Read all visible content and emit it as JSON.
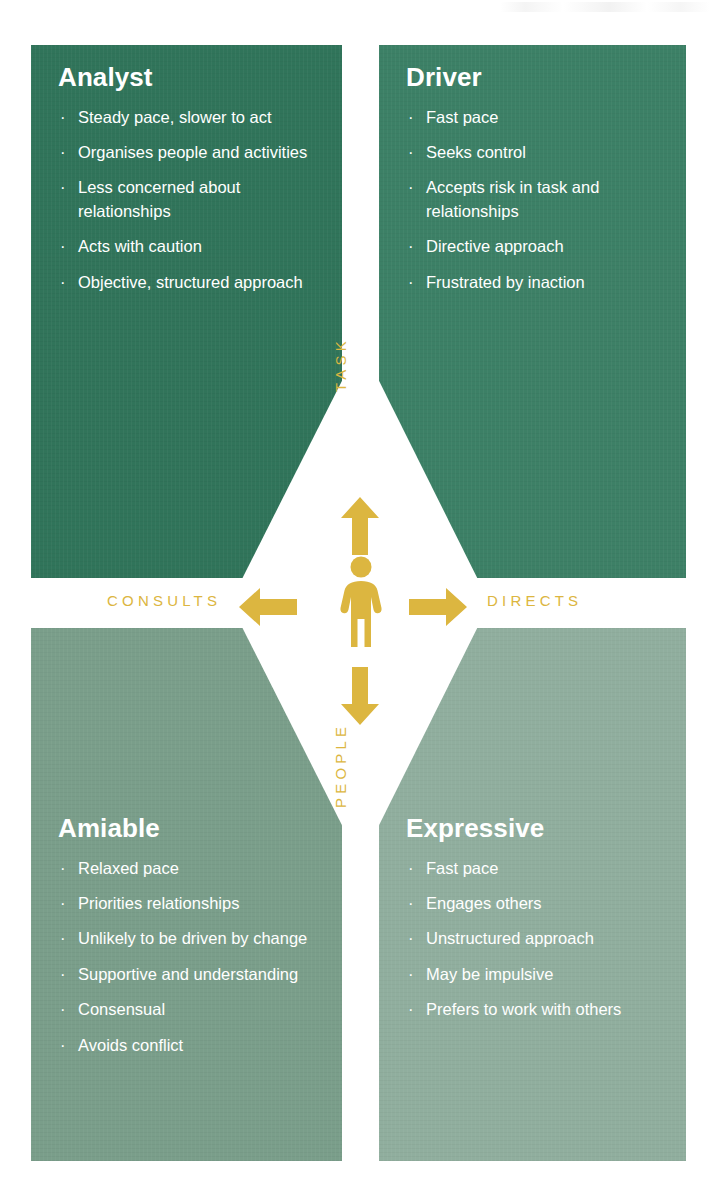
{
  "diagram": {
    "colors": {
      "analyst_bg": "#31745a",
      "driver_bg": "#3d8066",
      "amiable_bg": "#7a9e8a",
      "expressive_bg": "#90ae9e",
      "accent_gold": "#dcb640",
      "text_on_panel": "#ffffff",
      "page_bg": "#ffffff"
    },
    "bullet_glyph": "·",
    "axes": {
      "vertical_top": "TASK",
      "vertical_bottom": "PEOPLE",
      "horizontal_left": "CONSULTS",
      "horizontal_right": "DIRECTS"
    },
    "center_icon": "person-icon",
    "arrows": [
      {
        "name": "arrow-up-icon",
        "direction": "up",
        "points_to": "TASK"
      },
      {
        "name": "arrow-down-icon",
        "direction": "down",
        "points_to": "PEOPLE"
      },
      {
        "name": "arrow-left-icon",
        "direction": "left",
        "points_to": "CONSULTS"
      },
      {
        "name": "arrow-right-icon",
        "direction": "right",
        "points_to": "DIRECTS"
      }
    ],
    "quadrants": [
      {
        "key": "analyst",
        "position": "top-left",
        "title": "Analyst",
        "traits": [
          "Steady pace, slower to act",
          "Organises people and activities",
          "Less concerned about relationships",
          "Acts with caution",
          "Objective, structured approach"
        ]
      },
      {
        "key": "driver",
        "position": "top-right",
        "title": "Driver",
        "traits": [
          "Fast pace",
          "Seeks control",
          "Accepts risk in task and relationships",
          "Directive approach",
          "Frustrated by inaction"
        ]
      },
      {
        "key": "amiable",
        "position": "bottom-left",
        "title": "Amiable",
        "traits": [
          "Relaxed pace",
          "Priorities relationships",
          "Unlikely to be driven by change",
          "Supportive and understanding",
          "Consensual",
          "Avoids conflict"
        ]
      },
      {
        "key": "expressive",
        "position": "bottom-right",
        "title": "Expressive",
        "traits": [
          "Fast pace",
          "Engages others",
          "Unstructured approach",
          "May be impulsive",
          "Prefers to work with others"
        ]
      }
    ]
  }
}
